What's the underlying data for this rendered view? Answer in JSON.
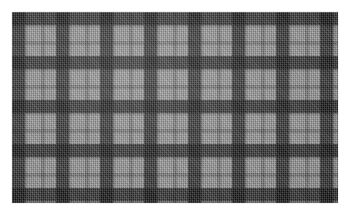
{
  "image": {
    "subject": "plaid-fabric-swatch",
    "description": "Grayscale tartan plaid woven fabric swatch photographed on a white background",
    "width": 347,
    "height": 215,
    "background_color": "#ffffff"
  },
  "swatch": {
    "label": "plaid fabric swatch",
    "left": 12,
    "top": 12,
    "width": 326,
    "height": 191,
    "pattern_name": "tartan check",
    "weave": "twill",
    "repeat_px": 44,
    "palette": {
      "ground": "#9d9d9d",
      "dark_band": "#3c3c3c",
      "mid_band": "#6e6e6e",
      "light_band": "#b4b4b4",
      "accent_line": "#f0f0f0"
    },
    "sett": [
      {
        "color_role": "dark_band",
        "hex": "#3c3c3c",
        "width_px": 13
      },
      {
        "color_role": "mid_band",
        "hex": "#7d7d7d",
        "width_px": 2
      },
      {
        "color_role": "light_band",
        "hex": "#afafaf",
        "width_px": 6
      },
      {
        "color_role": "accent_line",
        "hex": "#f0f0f0",
        "width_px": 2
      },
      {
        "color_role": "light_band",
        "hex": "#afafaf",
        "width_px": 6
      },
      {
        "color_role": "mid_band",
        "hex": "#6e6e6e",
        "width_px": 4
      },
      {
        "color_role": "light_band",
        "hex": "#afafaf",
        "width_px": 5
      },
      {
        "color_role": "accent_line",
        "hex": "#ebebeb",
        "width_px": 2
      },
      {
        "color_role": "light_band",
        "hex": "#afafaf",
        "width_px": 4
      }
    ]
  }
}
